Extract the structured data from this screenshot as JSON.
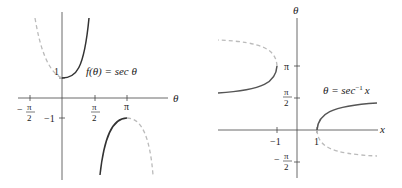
{
  "left_graph": {
    "title": "f(θ) = sec θ",
    "axis_label_x": "θ",
    "x_ticks": [
      {
        "label_num": "π",
        "label_den": "2",
        "sign": "−",
        "value": "-π/2"
      },
      {
        "label_num": "π",
        "label_den": "2",
        "sign": "",
        "value": "π/2"
      },
      {
        "label": "π",
        "value": "π"
      }
    ],
    "y_ticks": [
      {
        "label": "1",
        "value": 1
      },
      {
        "label": "−1",
        "value": -1
      }
    ],
    "function_label": "f(θ) = sec θ",
    "colors": {
      "solid": "#333333",
      "dashed": "#bbbbbb",
      "axis": "#444444"
    }
  },
  "right_graph": {
    "axis_label_x": "x",
    "axis_label_y": "θ",
    "x_ticks": [
      {
        "label": "−1",
        "value": -1
      },
      {
        "label": "1",
        "value": 1
      }
    ],
    "y_ticks": [
      {
        "label": "π",
        "value": "π"
      },
      {
        "label_num": "π",
        "label_den": "2",
        "sign": "",
        "value": "π/2"
      },
      {
        "label_num": "π",
        "label_den": "2",
        "sign": "−",
        "value": "-π/2"
      }
    ],
    "function_label_lhs": "θ = sec",
    "function_label_sup": "−1",
    "function_label_var": "x",
    "colors": {
      "solid": "#555555",
      "dashed": "#bbbbbb",
      "axis": "#444444"
    }
  }
}
